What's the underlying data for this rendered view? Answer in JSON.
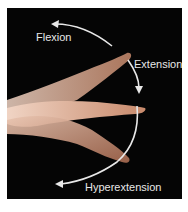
{
  "figure": {
    "labels": {
      "flexion": "Flexion",
      "extension": "Extension",
      "hyperextension": "Hyperextension"
    },
    "colors": {
      "background": "#050505",
      "border": "#ffffff",
      "arrows": "#e8e8e8",
      "skin": "#d8a888"
    }
  }
}
